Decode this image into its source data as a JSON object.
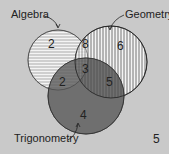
{
  "diagram": {
    "type": "venn",
    "sets": [
      {
        "name": "Algebra",
        "label": "Algebra",
        "only": "2",
        "color": "#f2f2f2",
        "pattern": "horizontal-lines"
      },
      {
        "name": "Geometry",
        "label": "Geometry",
        "only": "6",
        "color": "#f2f2f2",
        "pattern": "vertical-lines"
      },
      {
        "name": "Trigonometry",
        "label": "Trigonometry",
        "only": "4",
        "color": "#6e6e6e",
        "pattern": "solid-dark"
      }
    ],
    "regions": {
      "algebra_only": "2",
      "geometry_only": "6",
      "trigonometry_only": "4",
      "algebra_geometry": "8",
      "algebra_trigonometry": "2",
      "geometry_trigonometry": "5",
      "all_three": "3",
      "outside": "5"
    },
    "background_color": "#c9c9c9"
  }
}
